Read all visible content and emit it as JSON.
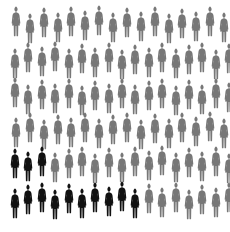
{
  "chart_data": {
    "type": "pictograph",
    "title": "",
    "total": 100,
    "highlighted": 13,
    "unhighlighted": 87,
    "unit": "woman figure",
    "series": [
      {
        "name": "highlighted",
        "color": "#111111",
        "count": 13
      },
      {
        "name": "other",
        "color": "#777777",
        "count": 87
      }
    ],
    "rows": [
      {
        "count": 16,
        "highlighted": 0
      },
      {
        "count": 17,
        "highlighted": 0
      },
      {
        "count": 17,
        "highlighted": 0
      },
      {
        "count": 16,
        "highlighted": 0
      },
      {
        "count": 17,
        "highlighted": 3
      },
      {
        "count": 17,
        "highlighted": 10
      }
    ],
    "legend": "none",
    "grid": false
  },
  "colors": {
    "highlight": "#111111",
    "base": "#777777",
    "background": "#ffffff"
  },
  "summary": "13 of 100 figures highlighted"
}
